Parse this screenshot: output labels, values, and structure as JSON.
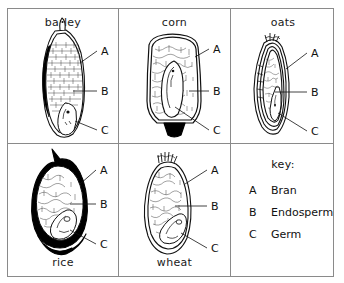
{
  "figure": {
    "title_alt": "Cross sections of cereal grains showing bran, endosperm and germ",
    "line_color": "#111111",
    "border_color": "#8a8a8a",
    "fill_color": "#ffffff",
    "solid_color": "#000000"
  },
  "cells": [
    {
      "id": "barley",
      "caption": "barley",
      "caption_position": "top",
      "labels": [
        {
          "letter": "A",
          "part": "bran"
        },
        {
          "letter": "B",
          "part": "endosperm"
        },
        {
          "letter": "C",
          "part": "germ"
        }
      ]
    },
    {
      "id": "corn",
      "caption": "corn",
      "caption_position": "top",
      "labels": [
        {
          "letter": "A",
          "part": "bran"
        },
        {
          "letter": "B",
          "part": "endosperm"
        },
        {
          "letter": "C",
          "part": "germ"
        }
      ]
    },
    {
      "id": "oats",
      "caption": "oats",
      "caption_position": "top",
      "labels": [
        {
          "letter": "A",
          "part": "bran"
        },
        {
          "letter": "B",
          "part": "endosperm"
        },
        {
          "letter": "C",
          "part": "germ"
        }
      ]
    },
    {
      "id": "rice",
      "caption": "rice",
      "caption_position": "bottom",
      "labels": [
        {
          "letter": "A",
          "part": "bran"
        },
        {
          "letter": "B",
          "part": "endosperm"
        },
        {
          "letter": "C",
          "part": "germ"
        }
      ]
    },
    {
      "id": "wheat",
      "caption": "wheat",
      "caption_position": "bottom",
      "labels": [
        {
          "letter": "A",
          "part": "bran"
        },
        {
          "letter": "B",
          "part": "endosperm"
        },
        {
          "letter": "C",
          "part": "germ"
        }
      ]
    }
  ],
  "key": {
    "title": "key:",
    "entries": [
      {
        "letter": "A",
        "label": "Bran"
      },
      {
        "letter": "B",
        "label": "Endosperm"
      },
      {
        "letter": "C",
        "label": "Germ"
      }
    ]
  }
}
